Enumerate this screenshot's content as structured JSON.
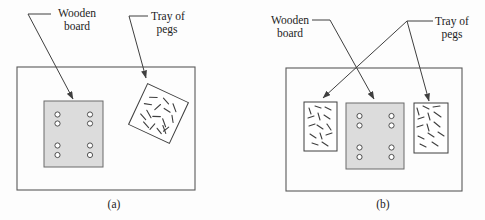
{
  "figure": {
    "type": "diagram",
    "description_visible_text_only": "",
    "colors": {
      "background": "#fdfdfd",
      "line": "#3f3f3f",
      "text": "#232323",
      "board_fill": "#dcdcdc",
      "board_stroke": "#6b6b6b",
      "tray_fill": "#ffffff",
      "hole_fill": "#ffffff",
      "table_stroke": "#5a5a5a"
    },
    "panels": [
      {
        "id": "a",
        "caption": "(a)",
        "labels": {
          "wooden_board": {
            "lines": [
              "Wooden",
              "board"
            ]
          },
          "tray_of_pegs": {
            "lines": [
              "Tray of",
              "pegs"
            ]
          }
        }
      },
      {
        "id": "b",
        "caption": "(b)",
        "labels": {
          "wooden_board": {
            "lines": [
              "Wooden",
              "board"
            ]
          },
          "tray_of_pegs": {
            "lines": [
              "Tray of",
              "pegs"
            ]
          }
        }
      }
    ]
  }
}
